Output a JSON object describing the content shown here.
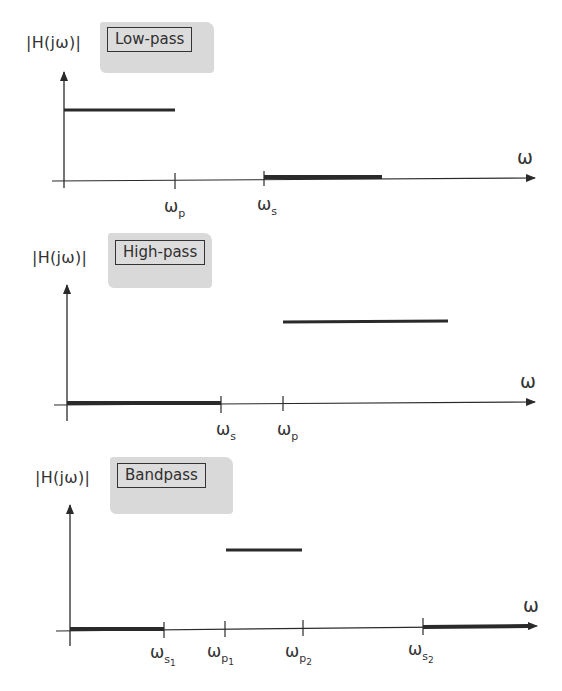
{
  "figure": {
    "omega_symbol": "ω",
    "panels": [
      {
        "ylabel": "|H(jω)|",
        "tag": "Low-pass",
        "xlabel": "ω",
        "ticks": [
          {
            "base": "ω",
            "sub": "p",
            "subsub": ""
          },
          {
            "base": "ω",
            "sub": "s",
            "subsub": ""
          }
        ]
      },
      {
        "ylabel": "|H(jω)|",
        "tag": "High-pass",
        "xlabel": "ω",
        "ticks": [
          {
            "base": "ω",
            "sub": "s",
            "subsub": ""
          },
          {
            "base": "ω",
            "sub": "p",
            "subsub": ""
          }
        ]
      },
      {
        "ylabel": "|H(jω)|",
        "tag": "Bandpass",
        "xlabel": "ω",
        "ticks": [
          {
            "base": "ω",
            "sub": "s",
            "subsub": "1"
          },
          {
            "base": "ω",
            "sub": "p",
            "subsub": "1"
          },
          {
            "base": "ω",
            "sub": "p",
            "subsub": "2"
          },
          {
            "base": "ω",
            "sub": "s",
            "subsub": "2"
          }
        ]
      }
    ]
  },
  "colors": {
    "ink": "#2a2a2a",
    "tag_shade": "#d9d9d9"
  }
}
